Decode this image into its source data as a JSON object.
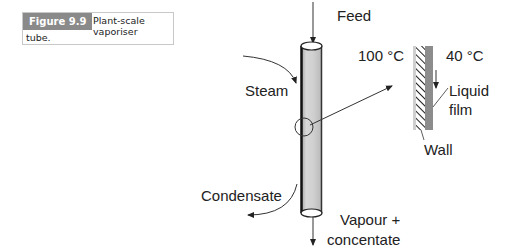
{
  "caption": {
    "tag": "Figure 9.9",
    "text_line1": "Plant-scale vaporiser",
    "text_line2": "tube.",
    "tag_color": "#8a8a8a"
  },
  "diagram": {
    "labels": {
      "feed": "Feed",
      "steam": "Steam",
      "condensate": "Condensate",
      "vapour_line1": "Vapour +",
      "vapour_line2": "concentate",
      "temp_hot": "100 °C",
      "temp_cold": "40 °C",
      "liquid_line1": "Liquid",
      "liquid_line2": "film",
      "wall": "Wall"
    },
    "colors": {
      "tube_fill": "#cfcfcf",
      "wall_fill": "#bdbdbd",
      "film_fill": "#8c8c8c",
      "line": "#333333"
    }
  }
}
